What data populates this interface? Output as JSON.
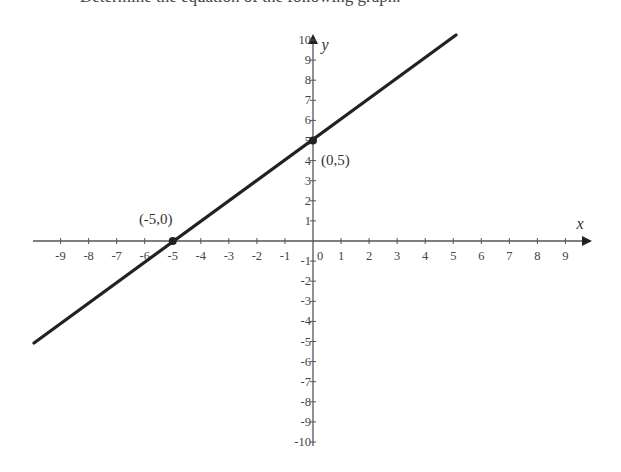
{
  "header": {
    "clipped_text": "Determine the equation of the following graph."
  },
  "chart_data": {
    "type": "line",
    "title": "",
    "xlabel": "x",
    "ylabel": "y",
    "xlim": [
      -10,
      10
    ],
    "ylim": [
      -10,
      10
    ],
    "x_ticks": [
      -9,
      -8,
      -7,
      -6,
      -5,
      -4,
      -3,
      -2,
      -1,
      0,
      1,
      2,
      3,
      4,
      5,
      6,
      7,
      8,
      9
    ],
    "y_ticks": [
      -10,
      -9,
      -8,
      -7,
      -6,
      -5,
      -4,
      -3,
      -2,
      -1,
      1,
      2,
      3,
      4,
      5,
      6,
      7,
      8,
      9,
      10
    ],
    "grid": false,
    "series": [
      {
        "name": "y = x + 5",
        "x": [
          -10,
          5
        ],
        "y": [
          -5,
          10
        ],
        "slope": 1,
        "intercept": 5
      }
    ],
    "points": [
      {
        "x": -5,
        "y": 0,
        "label": "(-5,0)"
      },
      {
        "x": 0,
        "y": 5,
        "label": "(0,5)"
      }
    ]
  }
}
